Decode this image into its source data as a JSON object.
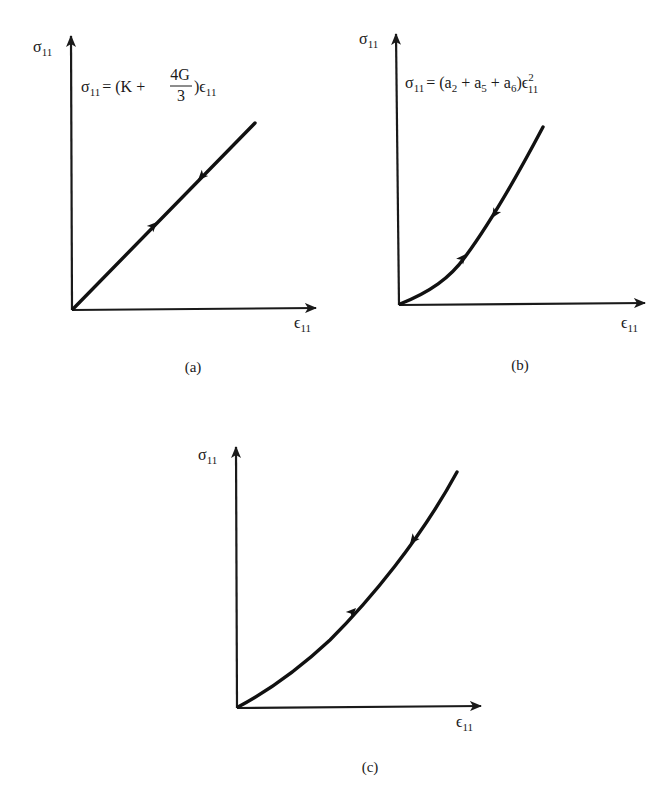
{
  "figure": {
    "panels": [
      {
        "id": "a",
        "caption": "(a)",
        "y_axis_label": {
          "symbol": "σ",
          "subscript": "11"
        },
        "x_axis_label": {
          "symbol": "ϵ",
          "subscript": "11"
        },
        "equation": {
          "lhs": "σ",
          "lhs_sub": "11",
          "eq_open": "= (K +",
          "frac_num": "4G",
          "frac_den": "3",
          "close": ")ϵ",
          "close_sub": "11"
        },
        "curve_type": "linear",
        "arrows": [
          "loading (up)",
          "unloading (down)"
        ]
      },
      {
        "id": "b",
        "caption": "(b)",
        "y_axis_label": {
          "symbol": "σ",
          "subscript": "11"
        },
        "x_axis_label": {
          "symbol": "ϵ",
          "subscript": "11"
        },
        "equation": {
          "lhs": "σ",
          "lhs_sub": "11",
          "body": "= (a",
          "a2_sub": "2",
          "plus1": " + a",
          "a5_sub": "5",
          "plus2": " + a",
          "a6_sub": "6",
          "close": ")ϵ",
          "eps_sup": "2",
          "eps_sub": "11"
        },
        "curve_type": "quadratic",
        "arrows": [
          "loading (up)",
          "unloading (down)"
        ]
      },
      {
        "id": "c",
        "caption": "(c)",
        "y_axis_label": {
          "symbol": "σ",
          "subscript": "11"
        },
        "x_axis_label": {
          "symbol": "ϵ",
          "subscript": "11"
        },
        "curve_type": "nonlinear (mildly convex)",
        "arrows": [
          "loading (up)",
          "unloading (down)"
        ]
      }
    ]
  },
  "colors": {
    "ink": "#111111",
    "background": "#ffffff"
  }
}
